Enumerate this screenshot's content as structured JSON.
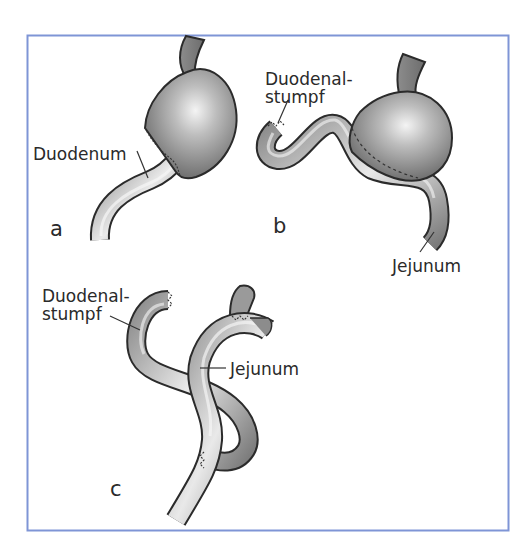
{
  "figure": {
    "frame_color": "#7f95d6",
    "organ_fill_dark": "#6f6f6f",
    "organ_fill_light": "#f2f2f2",
    "panels": [
      {
        "id": "a",
        "letter": "a",
        "labels": [
          {
            "text": "Duodenum"
          }
        ]
      },
      {
        "id": "b",
        "letter": "b",
        "labels": [
          {
            "line1": "Duodenal-",
            "line2": "stumpf"
          },
          {
            "text": "Jejunum"
          }
        ]
      },
      {
        "id": "c",
        "letter": "c",
        "labels": [
          {
            "line1": "Duodenal-",
            "line2": "stumpf"
          },
          {
            "text": "Jejunum"
          }
        ]
      }
    ]
  }
}
